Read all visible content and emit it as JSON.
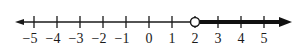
{
  "diagram": {
    "type": "number-line",
    "min": -5,
    "max": 5,
    "ticks": [
      {
        "value": -5,
        "label": "−5"
      },
      {
        "value": -4,
        "label": "−4"
      },
      {
        "value": -3,
        "label": "−3"
      },
      {
        "value": -2,
        "label": "−2"
      },
      {
        "value": -1,
        "label": "−1"
      },
      {
        "value": 0,
        "label": "0"
      },
      {
        "value": 1,
        "label": "1"
      },
      {
        "value": 2,
        "label": "2"
      },
      {
        "value": 3,
        "label": "3"
      },
      {
        "value": 4,
        "label": "4"
      },
      {
        "value": 5,
        "label": "5"
      }
    ],
    "endpoint": {
      "value": 2,
      "type": "open-circle"
    },
    "ray": {
      "from": 2,
      "direction": "right"
    },
    "colors": {
      "line": "#1a1a1a",
      "ray": "#111111",
      "background": "#ffffff"
    }
  }
}
